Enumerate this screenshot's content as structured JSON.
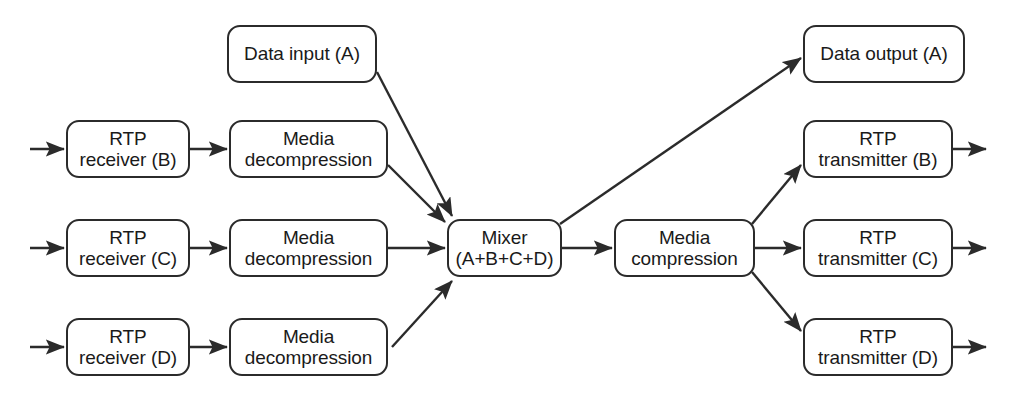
{
  "diagram": {
    "type": "block-flow-diagram",
    "background_color": "#ffffff",
    "stroke_color": "#2b2b2b",
    "text_color": "#1a1a1a",
    "nodes": [
      {
        "id": "data-input-a",
        "line1": "Data input (A)",
        "line2": "",
        "x": 227,
        "y": 25,
        "w": 150,
        "h": 58
      },
      {
        "id": "rtp-receiver-b",
        "line1": "RTP",
        "line2": "receiver (B)",
        "x": 66,
        "y": 120,
        "w": 124,
        "h": 58
      },
      {
        "id": "media-decompress-b",
        "line1": "Media",
        "line2": "decompression",
        "x": 229,
        "y": 120,
        "w": 159,
        "h": 58
      },
      {
        "id": "rtp-receiver-c",
        "line1": "RTP",
        "line2": "receiver (C)",
        "x": 66,
        "y": 219,
        "w": 124,
        "h": 58
      },
      {
        "id": "media-decompress-c",
        "line1": "Media",
        "line2": "decompression",
        "x": 229,
        "y": 219,
        "w": 159,
        "h": 58
      },
      {
        "id": "rtp-receiver-d",
        "line1": "RTP",
        "line2": "receiver (D)",
        "x": 66,
        "y": 318,
        "w": 124,
        "h": 58
      },
      {
        "id": "media-decompress-d",
        "line1": "Media",
        "line2": "decompression",
        "x": 229,
        "y": 318,
        "w": 159,
        "h": 58
      },
      {
        "id": "mixer",
        "line1": "Mixer",
        "line2": "(A+B+C+D)",
        "x": 447,
        "y": 219,
        "w": 115,
        "h": 58
      },
      {
        "id": "media-compression",
        "line1": "Media",
        "line2": "compression",
        "x": 614,
        "y": 219,
        "w": 141,
        "h": 58
      },
      {
        "id": "data-output-a",
        "line1": "Data output (A)",
        "line2": "",
        "x": 803,
        "y": 25,
        "w": 162,
        "h": 58
      },
      {
        "id": "rtp-transmitter-b",
        "line1": "RTP",
        "line2": "transmitter (B)",
        "x": 803,
        "y": 120,
        "w": 150,
        "h": 58
      },
      {
        "id": "rtp-transmitter-c",
        "line1": "RTP",
        "line2": "transmitter (C)",
        "x": 803,
        "y": 219,
        "w": 150,
        "h": 58
      },
      {
        "id": "rtp-transmitter-d",
        "line1": "RTP",
        "line2": "transmitter (D)",
        "x": 803,
        "y": 318,
        "w": 150,
        "h": 58
      }
    ],
    "edges": [
      {
        "id": "in-b",
        "from": "external-source-b",
        "to": "rtp-receiver-b",
        "x1": 30,
        "y1": 149,
        "x2": 64,
        "y2": 149
      },
      {
        "id": "in-c",
        "from": "external-source-c",
        "to": "rtp-receiver-c",
        "x1": 30,
        "y1": 248,
        "x2": 64,
        "y2": 248
      },
      {
        "id": "in-d",
        "from": "external-source-d",
        "to": "rtp-receiver-d",
        "x1": 30,
        "y1": 347,
        "x2": 64,
        "y2": 347
      },
      {
        "id": "b-rx-to-decomp",
        "from": "rtp-receiver-b",
        "to": "media-decompress-b",
        "x1": 190,
        "y1": 149,
        "x2": 227,
        "y2": 149
      },
      {
        "id": "c-rx-to-decomp",
        "from": "rtp-receiver-c",
        "to": "media-decompress-c",
        "x1": 190,
        "y1": 248,
        "x2": 227,
        "y2": 248
      },
      {
        "id": "d-rx-to-decomp",
        "from": "rtp-receiver-d",
        "to": "media-decompress-d",
        "x1": 190,
        "y1": 347,
        "x2": 227,
        "y2": 347
      },
      {
        "id": "input-a-to-mixer",
        "from": "data-input-a",
        "to": "mixer",
        "x1": 377,
        "y1": 72,
        "x2": 452,
        "y2": 216
      },
      {
        "id": "b-decomp-to-mixer",
        "from": "media-decompress-b",
        "to": "mixer",
        "x1": 388,
        "y1": 165,
        "x2": 445,
        "y2": 222
      },
      {
        "id": "c-decomp-to-mixer",
        "from": "media-decompress-c",
        "to": "mixer",
        "x1": 388,
        "y1": 248,
        "x2": 445,
        "y2": 248
      },
      {
        "id": "d-decomp-to-mixer",
        "from": "media-decompress-d",
        "to": "mixer",
        "x1": 392,
        "y1": 347,
        "x2": 452,
        "y2": 281
      },
      {
        "id": "mixer-to-compress",
        "from": "mixer",
        "to": "media-compression",
        "x1": 562,
        "y1": 248,
        "x2": 612,
        "y2": 248
      },
      {
        "id": "mixer-to-output-a",
        "from": "mixer",
        "to": "data-output-a",
        "x1": 560,
        "y1": 224,
        "x2": 801,
        "y2": 58
      },
      {
        "id": "compress-to-tx-b",
        "from": "media-compression",
        "to": "rtp-transmitter-b",
        "x1": 752,
        "y1": 224,
        "x2": 801,
        "y2": 165
      },
      {
        "id": "compress-to-tx-c",
        "from": "media-compression",
        "to": "rtp-transmitter-c",
        "x1": 755,
        "y1": 248,
        "x2": 801,
        "y2": 248
      },
      {
        "id": "compress-to-tx-d",
        "from": "media-compression",
        "to": "rtp-transmitter-d",
        "x1": 752,
        "y1": 272,
        "x2": 801,
        "y2": 331
      },
      {
        "id": "out-b",
        "from": "rtp-transmitter-b",
        "to": "external-sink-b",
        "x1": 953,
        "y1": 149,
        "x2": 986,
        "y2": 149
      },
      {
        "id": "out-c",
        "from": "rtp-transmitter-c",
        "to": "external-sink-c",
        "x1": 953,
        "y1": 248,
        "x2": 986,
        "y2": 248
      },
      {
        "id": "out-d",
        "from": "rtp-transmitter-d",
        "to": "external-sink-d",
        "x1": 953,
        "y1": 347,
        "x2": 986,
        "y2": 347
      }
    ]
  }
}
